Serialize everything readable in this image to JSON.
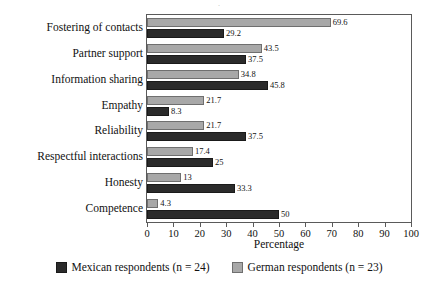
{
  "figure": {
    "title_remnant": "."
  },
  "chart_data": {
    "type": "bar",
    "orientation": "horizontal",
    "title": "",
    "xlabel": "Percentage",
    "ylabel": "",
    "xlim": [
      0,
      100
    ],
    "xticks": [
      0,
      10,
      20,
      30,
      40,
      50,
      60,
      70,
      80,
      90,
      100
    ],
    "xtick_labels": [
      "0",
      "10",
      "20",
      "30",
      "40",
      "50",
      "60",
      "70",
      "80",
      "90",
      "100"
    ],
    "grid": false,
    "legend_position": "bottom",
    "categories": [
      "Fostering of contacts",
      "Partner support",
      "Information sharing",
      "Empathy",
      "Reliability",
      "Respectful interactions",
      "Honesty",
      "Competence"
    ],
    "series": [
      {
        "name": "German respondents (n = 23)",
        "color": "#a8a8a8",
        "values": [
          69.6,
          43.5,
          34.8,
          21.7,
          21.7,
          17.4,
          13,
          4.3
        ],
        "value_labels": [
          "69.6",
          "43.5",
          "34.8",
          "21.7",
          "21.7",
          "17.4",
          "13",
          "4.3"
        ]
      },
      {
        "name": "Mexican respondents (n = 24)",
        "color": "#2b2b2b",
        "values": [
          29.2,
          37.5,
          45.8,
          8.3,
          37.5,
          25,
          33.3,
          50
        ],
        "value_labels": [
          "29.2",
          "37.5",
          "45.8",
          "8.3",
          "37.5",
          "25",
          "33.3",
          "50"
        ]
      }
    ]
  },
  "legend": {
    "items": [
      {
        "label": "Mexican respondents (n = 24)",
        "key": "mexican"
      },
      {
        "label": "German respondents (n = 23)",
        "key": "german"
      }
    ]
  }
}
